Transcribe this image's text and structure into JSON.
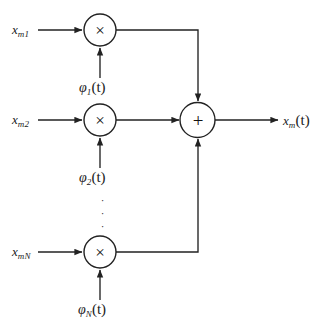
{
  "diagram": {
    "type": "block-diagram",
    "background_color": "#ffffff",
    "line_color": "#222222",
    "text_color": "#1a1a1a"
  },
  "branches": [
    {
      "id": "branch-1",
      "input_label": {
        "base": "x",
        "subscript": "m1"
      },
      "carrier_label": {
        "base": "φ",
        "subscript": "1",
        "argument": "(t)"
      },
      "operator": "×",
      "operator_name": "multiplier"
    },
    {
      "id": "branch-2",
      "input_label": {
        "base": "x",
        "subscript": "m2"
      },
      "carrier_label": {
        "base": "φ",
        "subscript": "2",
        "argument": "(t)"
      },
      "operator": "×",
      "operator_name": "multiplier"
    },
    {
      "id": "branch-n",
      "input_label": {
        "base": "x",
        "subscript": "mN"
      },
      "carrier_label": {
        "base": "φ",
        "subscript": "N",
        "argument": "(t)"
      },
      "operator": "×",
      "operator_name": "multiplier"
    }
  ],
  "summer": {
    "operator": "+",
    "operator_name": "summing-junction"
  },
  "output": {
    "label": {
      "base": "x",
      "subscript": "m",
      "argument": "(t)"
    }
  },
  "ellipsis": {
    "glyph": "·",
    "count": 3,
    "orientation": "vertical"
  }
}
